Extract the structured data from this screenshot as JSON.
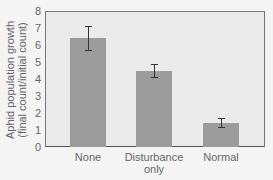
{
  "chart_data": {
    "type": "bar",
    "title": "",
    "xlabel": "",
    "ylabel": "Aphid population growth (final count/initial count)",
    "ylabel_lines": [
      "Aphid population growth",
      "(final count/initial count)"
    ],
    "categories": [
      "None",
      "Disturbance only",
      "Normal"
    ],
    "category_lines": [
      [
        "None"
      ],
      [
        "Disturbance",
        "only"
      ],
      [
        "Normal"
      ]
    ],
    "values": [
      6.4,
      4.5,
      1.4
    ],
    "error": [
      {
        "low": 5.7,
        "high": 7.1
      },
      {
        "low": 4.1,
        "high": 4.9
      },
      {
        "low": 1.2,
        "high": 1.7
      }
    ],
    "ylim": [
      0,
      8
    ],
    "yticks": [
      0,
      1,
      2,
      3,
      4,
      5,
      6,
      7,
      8
    ],
    "grid": false,
    "legend": null,
    "colors": {
      "bar": "#9c9c9c",
      "plot_bg": "#ebebeb",
      "error_bar": "#333333"
    }
  }
}
